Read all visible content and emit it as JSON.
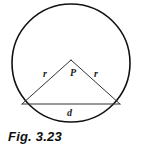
{
  "figure": {
    "caption": "Fig. 3.23",
    "background_color": "#ffffff",
    "stroke_color": "#111111",
    "labels": {
      "radius_left": "r",
      "radius_right": "r",
      "center_point": "P",
      "chord": "d"
    }
  },
  "chart_data": {
    "type": "diagram",
    "title": "Fig. 3.23",
    "shapes": [
      {
        "name": "circle",
        "kind": "circle",
        "cx": 71,
        "cy": 63,
        "r": 59,
        "fill": "none",
        "stroke": "#111111",
        "stroke_width": 1.6
      },
      {
        "name": "radius-left",
        "kind": "line",
        "x1": 71,
        "y1": 60,
        "x2": 22,
        "y2": 104,
        "stroke": "#333333",
        "stroke_width": 1
      },
      {
        "name": "radius-right",
        "kind": "line",
        "x1": 71,
        "y1": 60,
        "x2": 120,
        "y2": 104,
        "stroke": "#333333",
        "stroke_width": 1
      },
      {
        "name": "chord",
        "kind": "line",
        "x1": 22,
        "y1": 104,
        "x2": 120,
        "y2": 104,
        "stroke": "#333333",
        "stroke_width": 1.2
      }
    ],
    "annotations": [
      {
        "text": "r",
        "x": 46,
        "y": 74,
        "refers_to": "radius-left"
      },
      {
        "text": "P",
        "x": 73,
        "y": 73,
        "refers_to": "apex-point"
      },
      {
        "text": "r",
        "x": 97,
        "y": 74,
        "refers_to": "radius-right"
      },
      {
        "text": "d",
        "x": 70,
        "y": 113,
        "refers_to": "chord"
      }
    ],
    "xlabel": "",
    "ylabel": "",
    "grid": false,
    "legend": false
  }
}
